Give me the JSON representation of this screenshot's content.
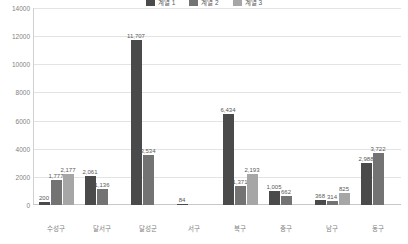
{
  "chart_data": {
    "type": "bar",
    "title": "",
    "xlabel": "",
    "ylabel": "",
    "ylim": [
      0,
      14000
    ],
    "grid": true,
    "legend_position": "top-center",
    "yticks": [
      14000,
      12000,
      10000,
      8000,
      6000,
      4000,
      2000,
      0
    ],
    "ytick_labels": [
      "14000",
      "12000",
      "10000",
      "8000",
      "6000",
      "4000",
      "2000",
      "0"
    ],
    "categories": [
      "수성구",
      "달서구",
      "달성군",
      "서구",
      "북구",
      "중구",
      "남구",
      "동구"
    ],
    "series": [
      {
        "name": "계열 1",
        "color": "#4a4a4a",
        "values": [
          200,
          2061,
          11707,
          84,
          6434,
          1005,
          368,
          2988
        ],
        "labels": [
          "200",
          "2,061",
          "11,707",
          "84",
          "6,434",
          "1,005",
          "368",
          "2,988"
        ]
      },
      {
        "name": "계열 2",
        "color": "#737373",
        "values": [
          1777,
          1136,
          3534,
          0,
          1371,
          662,
          314,
          3722
        ],
        "labels": [
          "1,777",
          "1,136",
          "3,534",
          "",
          "1,371",
          "662",
          "314",
          "3,722"
        ]
      },
      {
        "name": "계열 3",
        "color": "#a6a6a6",
        "values": [
          2177,
          0,
          0,
          0,
          2193,
          0,
          825,
          0
        ],
        "labels": [
          "2,177",
          "",
          "",
          "",
          "2,193",
          "",
          "825",
          ""
        ]
      }
    ]
  },
  "legend": {
    "items": [
      {
        "label": "계열 1",
        "color": "#4a4a4a"
      },
      {
        "label": "계열 2",
        "color": "#737373"
      },
      {
        "label": "계열 3",
        "color": "#a6a6a6"
      }
    ]
  }
}
